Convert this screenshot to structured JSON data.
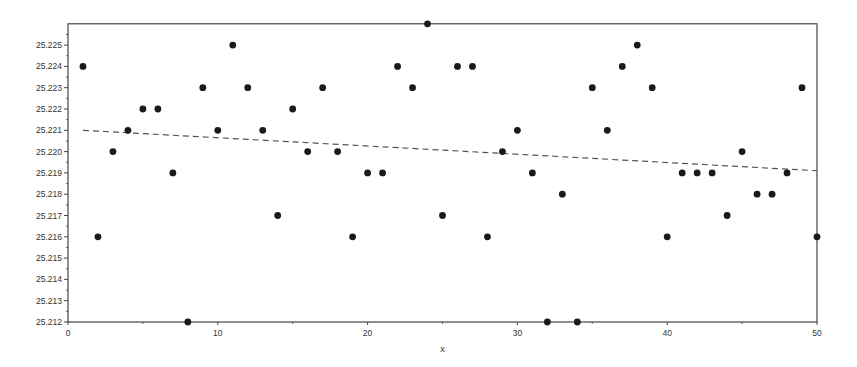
{
  "chart_data": {
    "type": "scatter",
    "title": "",
    "xlabel": "x",
    "ylabel": "",
    "xlim": [
      0,
      50
    ],
    "ylim": [
      25.212,
      25.226
    ],
    "grid": false,
    "legend": null,
    "x_ticks": [
      0,
      10,
      20,
      30,
      40,
      50
    ],
    "y_ticks": [
      "25.212",
      "25.213",
      "25.214",
      "25.215",
      "25.216",
      "25.217",
      "25.218",
      "25.219",
      "25.220",
      "25.221",
      "25.222",
      "25.223",
      "25.224",
      "25.225"
    ],
    "series": [
      {
        "name": "observations",
        "marker": "filled-circle",
        "color": "#1a1a1a",
        "x": [
          1,
          2,
          3,
          4,
          5,
          6,
          7,
          8,
          9,
          10,
          11,
          12,
          13,
          14,
          15,
          16,
          17,
          18,
          19,
          20,
          21,
          22,
          23,
          24,
          25,
          26,
          27,
          28,
          29,
          30,
          31,
          32,
          33,
          34,
          35,
          36,
          37,
          38,
          39,
          40,
          41,
          42,
          43,
          44,
          45,
          46,
          47,
          48,
          49,
          50
        ],
        "y": [
          25.224,
          25.216,
          25.22,
          25.221,
          25.222,
          25.222,
          25.219,
          25.212,
          25.223,
          25.221,
          25.225,
          25.223,
          25.221,
          25.217,
          25.222,
          25.22,
          25.223,
          25.22,
          25.216,
          25.219,
          25.219,
          25.224,
          25.223,
          25.226,
          25.217,
          25.224,
          25.224,
          25.216,
          25.22,
          25.221,
          25.219,
          25.212,
          25.218,
          25.212,
          25.223,
          25.221,
          25.224,
          25.225,
          25.223,
          25.216,
          25.219,
          25.219,
          25.219,
          25.217,
          25.22,
          25.218,
          25.218,
          25.219,
          25.223,
          25.216
        ]
      },
      {
        "name": "trend line",
        "style": "dashed",
        "color": "#555555",
        "x": [
          1,
          50
        ],
        "y": [
          25.221,
          25.2191
        ]
      }
    ]
  },
  "axes": {
    "x_label": "x",
    "x_tick_labels": [
      "0",
      "10",
      "20",
      "30",
      "40",
      "50"
    ],
    "y_tick_labels": [
      "25.212",
      "25.213",
      "25.214",
      "25.215",
      "25.216",
      "25.217",
      "25.218",
      "25.219",
      "25.220",
      "25.221",
      "25.222",
      "25.223",
      "25.224",
      "25.225"
    ]
  }
}
